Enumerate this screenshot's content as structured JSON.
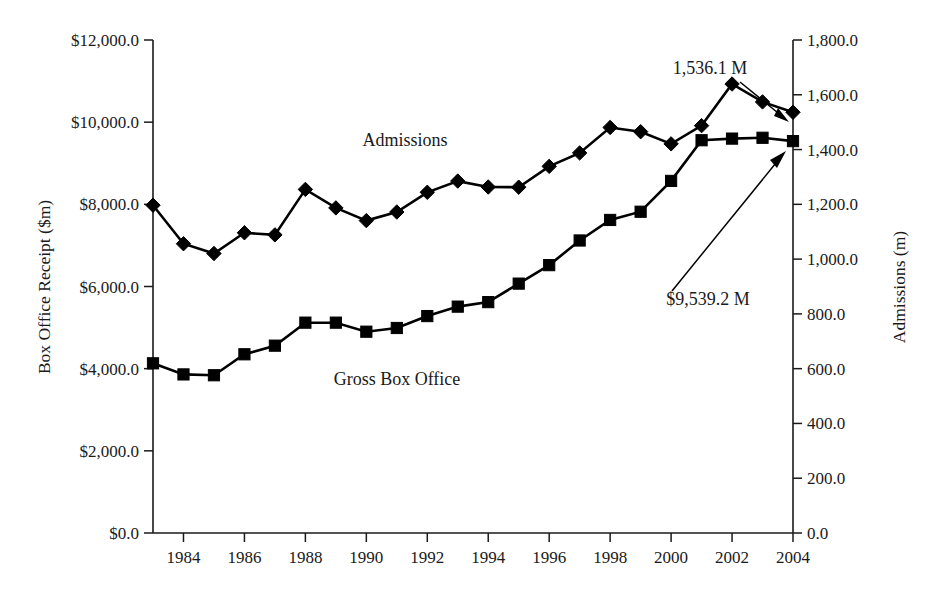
{
  "chart_data": {
    "type": "line",
    "title": "",
    "xlabel": "",
    "ylabel": "Box Office Receipt ($m)",
    "y2label": "Admissions (m)",
    "grid": false,
    "legend": "inline-labels",
    "x": [
      1983,
      1984,
      1985,
      1986,
      1987,
      1988,
      1989,
      1990,
      1991,
      1992,
      1993,
      1994,
      1995,
      1996,
      1997,
      1998,
      1999,
      2000,
      2001,
      2002,
      2003,
      2004
    ],
    "xtick_labels": [
      "1984",
      "1986",
      "1988",
      "1990",
      "1992",
      "1994",
      "1996",
      "1998",
      "2000",
      "2002",
      "2004"
    ],
    "xtick_values": [
      1984,
      1986,
      1988,
      1990,
      1992,
      1994,
      1996,
      1998,
      2000,
      2002,
      2004
    ],
    "xlim": [
      1983,
      2004
    ],
    "ylim": [
      0,
      12000
    ],
    "ytick_labels": [
      "$0.0",
      "$2,000.0",
      "$4,000.0",
      "$6,000.0",
      "$8,000.0",
      "$10,000.0",
      "$12,000.0"
    ],
    "ytick_values": [
      0,
      2000,
      4000,
      6000,
      8000,
      10000,
      12000
    ],
    "y2lim": [
      0,
      1800
    ],
    "y2tick_labels": [
      "0.0",
      "200.0",
      "400.0",
      "600.0",
      "800.0",
      "1,000.0",
      "1,200.0",
      "1,400.0",
      "1,600.0",
      "1,800.0"
    ],
    "y2tick_values": [
      0,
      200,
      400,
      600,
      800,
      1000,
      1200,
      1400,
      1600,
      1800
    ],
    "series": [
      {
        "name": "Admissions",
        "axis": "right",
        "units": "m",
        "marker": "diamond",
        "label_text": "Admissions",
        "values": [
          1196.9,
          1056.1,
          1020.5,
          1096.2,
          1088.5,
          1254.5,
          1187.0,
          1140.6,
          1172.0,
          1244.0,
          1285.0,
          1263.2,
          1262.6,
          1338.6,
          1387.7,
          1480.7,
          1465.2,
          1420.8,
          1487.3,
          1639.3,
          1574.0,
          1536.1
        ]
      },
      {
        "name": "Gross Box Office",
        "axis": "left",
        "units": "$m",
        "marker": "square",
        "label_text": "Gross Box Office",
        "values": [
          4130.0,
          3860.0,
          3840.0,
          4350.0,
          4560.0,
          5120.0,
          5120.0,
          4900.0,
          4990.0,
          5280.0,
          5510.0,
          5620.0,
          6070.0,
          6520.0,
          7120.0,
          7620.0,
          7820.0,
          8570.0,
          9560.0,
          9600.0,
          9620.0,
          9539.2
        ]
      }
    ],
    "annotations": [
      {
        "id": "admissions-endpoint",
        "text": "1,536.1 M",
        "points_to_series": "Admissions",
        "points_to_x": 2004,
        "points_to_value": 1536.1
      },
      {
        "id": "gross-endpoint",
        "text": "$9,539.2 M",
        "points_to_series": "Gross Box Office",
        "points_to_x": 2004,
        "points_to_value": 9539.2
      }
    ]
  }
}
